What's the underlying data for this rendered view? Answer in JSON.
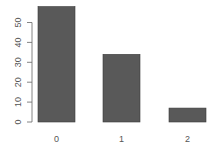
{
  "chart_data": {
    "type": "bar",
    "title": "",
    "xlabel": "",
    "ylabel": "",
    "categories": [
      "0",
      "1",
      "2"
    ],
    "values": [
      58,
      34,
      7
    ],
    "ylim": [
      0,
      60
    ],
    "yticks": [
      0,
      10,
      20,
      30,
      40,
      50
    ],
    "grid": false,
    "legend": null,
    "bar_color": "#595959"
  }
}
